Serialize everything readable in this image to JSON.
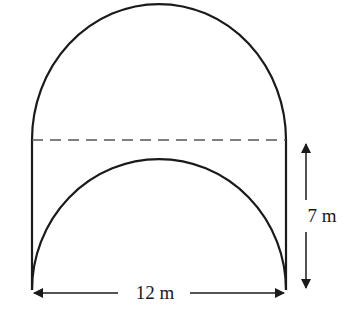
{
  "diagram": {
    "labels": {
      "width": "12 m",
      "height": "7 m"
    },
    "colors": {
      "stroke": "#1a1a1a",
      "dashed": "#555555",
      "background": "#ffffff"
    }
  }
}
